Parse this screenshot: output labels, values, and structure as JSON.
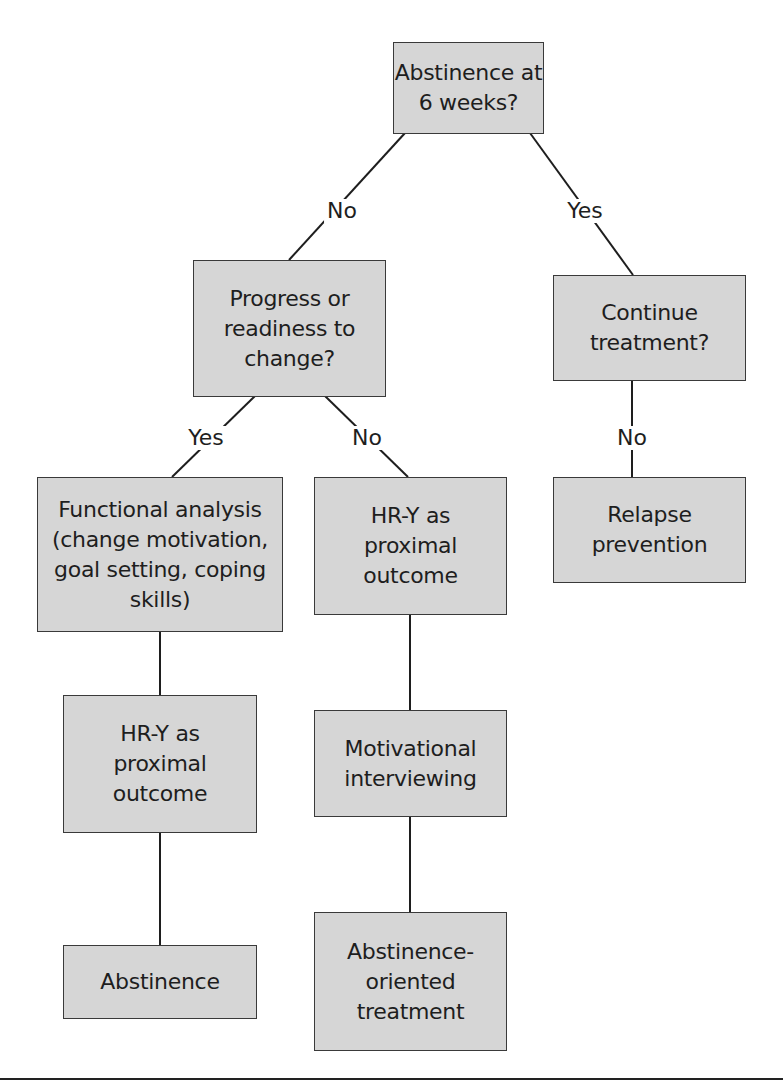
{
  "diagram": {
    "type": "decision-tree",
    "nodes": {
      "root": {
        "text": "Abstinence at\n6 weeks?"
      },
      "progress": {
        "text": "Progress or\nreadiness to\nchange?"
      },
      "continue": {
        "text": "Continue\ntreatment?"
      },
      "functional": {
        "text": "Functional analysis\n(change motivation,\ngoal setting, coping\nskills)"
      },
      "hry_mid": {
        "text": "HR-Y as\nproximal\noutcome"
      },
      "relapse": {
        "text": "Relapse\nprevention"
      },
      "hry_left": {
        "text": "HR-Y as\nproximal\noutcome"
      },
      "mi": {
        "text": "Motivational\ninterviewing"
      },
      "abstinence": {
        "text": "Abstinence"
      },
      "abst_oriented": {
        "text": "Abstinence-\noriented\ntreatment"
      }
    },
    "edge_labels": {
      "root_no": "No",
      "root_yes": "Yes",
      "progress_yes": "Yes",
      "progress_no": "No",
      "continue_no": "No"
    },
    "colors": {
      "box_fill": "#d6d6d6",
      "box_border": "#3a3a3a",
      "line": "#1e1e1e"
    }
  }
}
